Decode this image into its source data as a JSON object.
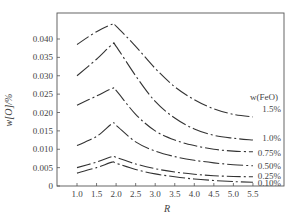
{
  "chart_data": {
    "type": "line",
    "title": "",
    "xlabel": "R",
    "ylabel": "w[O]/%",
    "xlim": [
      0.6,
      5.8
    ],
    "ylim": [
      0,
      0.047
    ],
    "x_ticks": [
      "1.0",
      "1.5",
      "2.0",
      "2.5",
      "3.0",
      "3.5",
      "4.0",
      "4.5",
      "5.0",
      "5.5"
    ],
    "y_ticks": [
      "0",
      "0.005",
      "0.010",
      "0.015",
      "0.020",
      "0.025",
      "0.030",
      "0.035",
      "0.040"
    ],
    "legend_title": "w(FeO)",
    "grid": false,
    "x": [
      1.0,
      1.5,
      1.9,
      2.0,
      2.5,
      3.0,
      3.5,
      4.0,
      4.5,
      5.0,
      5.5
    ],
    "series": [
      {
        "name": "1.5%",
        "values": [
          0.0385,
          0.042,
          0.044,
          0.0435,
          0.038,
          0.032,
          0.027,
          0.0235,
          0.021,
          0.0195,
          0.0188
        ]
      },
      {
        "name": "1.0%",
        "values": [
          0.03,
          0.0345,
          0.0385,
          0.038,
          0.03,
          0.023,
          0.0185,
          0.0155,
          0.0138,
          0.013,
          0.0125
        ]
      },
      {
        "name": "0.75%",
        "values": [
          0.022,
          0.0245,
          0.0265,
          0.026,
          0.0195,
          0.015,
          0.0125,
          0.011,
          0.01,
          0.0095,
          0.0093
        ]
      },
      {
        "name": "0.50%",
        "values": [
          0.011,
          0.0135,
          0.017,
          0.0165,
          0.012,
          0.0095,
          0.008,
          0.007,
          0.0063,
          0.0058,
          0.0055
        ]
      },
      {
        "name": "0.25%",
        "values": [
          0.005,
          0.0065,
          0.008,
          0.0078,
          0.006,
          0.0047,
          0.0038,
          0.0032,
          0.0028,
          0.0026,
          0.0025
        ]
      },
      {
        "name": "0.10%",
        "values": [
          0.0035,
          0.005,
          0.0065,
          0.0062,
          0.0045,
          0.0033,
          0.0025,
          0.0019,
          0.0015,
          0.0012,
          0.001
        ]
      }
    ],
    "legend_position": "right, inside plot"
  },
  "labels": {
    "xlabel": "R",
    "ylabel": "w[O]/%",
    "legend_title": "w(FeO)"
  },
  "colors": {
    "line": "#333333",
    "axis": "#555555"
  }
}
